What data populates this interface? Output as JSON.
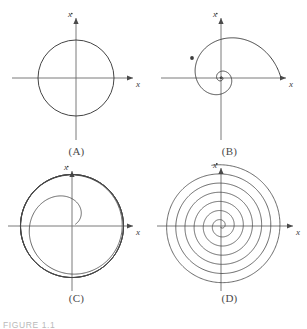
{
  "figure": {
    "caption": "FIGURE 1.1",
    "axis_labels": {
      "x": "x",
      "xdot": "x"
    },
    "colors": {
      "background": "#ffffff",
      "curve": "#3a3a3a",
      "axis": "#6b6b6b",
      "label": "#4a4a4a"
    }
  },
  "panels": [
    {
      "id": "A",
      "label": "(A)",
      "name": "closed-orbit",
      "xlabel": "x",
      "ylabel": "x"
    },
    {
      "id": "B",
      "label": "(B)",
      "name": "inward-spiral",
      "xlabel": "x",
      "ylabel": "x"
    },
    {
      "id": "C",
      "label": "(C)",
      "name": "spiral-to-limit-cycle",
      "xlabel": "x",
      "ylabel": "x"
    },
    {
      "id": "D",
      "label": "(D)",
      "name": "outward-spiral",
      "xlabel": "x",
      "ylabel": "x"
    }
  ],
  "chart_data": {
    "type": "line",
    "title": "",
    "xlabel": "x",
    "ylabel": "x-dot",
    "grid": false,
    "legend": "none",
    "plots": [
      {
        "panel": "A",
        "label": "(A)",
        "description": "Closed circular orbit (periodic solution / center)",
        "curve_type": "circle",
        "center": [
          0,
          0
        ],
        "radius": 1.0,
        "turns": 1,
        "arrows": 0,
        "xlim": [
          -1.6,
          1.6
        ],
        "ylim": [
          -1.6,
          1.6
        ]
      },
      {
        "panel": "B",
        "label": "(B)",
        "description": "Inward spiral converging to origin (stable focus)",
        "curve_type": "logarithmic-spiral-inward",
        "center": [
          0,
          0
        ],
        "r_start": 1.25,
        "r_end": 0.03,
        "decay": 0.28,
        "turns": 3.2,
        "theta_start": 0,
        "direction": "counterclockwise",
        "arrows": 1,
        "arrow_at_theta_deg": 150,
        "xlim": [
          -1.6,
          1.6
        ],
        "ylim": [
          -1.6,
          1.6
        ]
      },
      {
        "panel": "C",
        "label": "(C)",
        "description": "Spiral growing outward onto a stable limit cycle",
        "curve_type": "spiral-to-limit-cycle",
        "center": [
          0,
          0
        ],
        "r_start": 0.08,
        "r_limit": 1.12,
        "turns": 5.5,
        "direction": "counterclockwise",
        "arrows": 0,
        "xlim": [
          -1.6,
          1.6
        ],
        "ylim": [
          -1.6,
          1.6
        ]
      },
      {
        "panel": "D",
        "label": "(D)",
        "description": "Outward growing spiral (unstable focus)",
        "curve_type": "archimedean-spiral-outward",
        "center": [
          0,
          0
        ],
        "r_start": 0.02,
        "r_end": 1.28,
        "turns": 6.6,
        "direction": "counterclockwise",
        "arrows": 0,
        "xlim": [
          -1.6,
          1.6
        ],
        "ylim": [
          -1.6,
          1.6
        ]
      }
    ]
  }
}
